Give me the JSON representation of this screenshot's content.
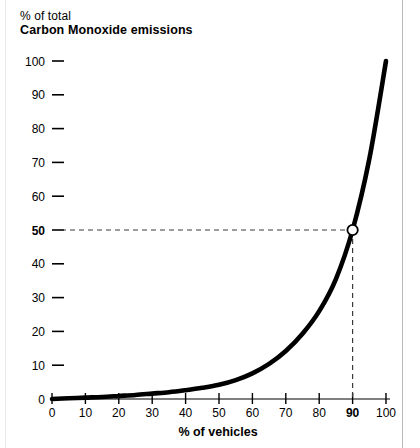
{
  "title": {
    "line1": "% of total",
    "line2": "Carbon Monoxide emissions"
  },
  "colors": {
    "background": "#ffffff",
    "curve": "#000000",
    "axis": "#000000",
    "tick": "#000000",
    "guide": "#555555",
    "marker_fill": "#ffffff",
    "marker_stroke": "#000000",
    "edge_rule": "#c9c9c9"
  },
  "chart_data": {
    "type": "line",
    "title": "% of total Carbon Monoxide emissions",
    "xlabel": "% of vehicles",
    "ylabel": "% of total Carbon Monoxide emissions",
    "xlim": [
      0,
      100
    ],
    "ylim": [
      0,
      100
    ],
    "grid": false,
    "legend": null,
    "xticks": [
      0,
      10,
      20,
      30,
      40,
      50,
      60,
      70,
      80,
      90,
      100
    ],
    "yticks": [
      0,
      10,
      20,
      30,
      40,
      50,
      60,
      70,
      80,
      90,
      100
    ],
    "xtick_labels": [
      "0",
      "10",
      "20",
      "30",
      "40",
      "50",
      "60",
      "70",
      "80",
      "90",
      "100"
    ],
    "ytick_labels": [
      "0",
      "10",
      "20",
      "30",
      "40",
      "50",
      "60",
      "70",
      "80",
      "90",
      "100"
    ],
    "emphasized_xtick": "90",
    "emphasized_ytick": "50",
    "series": [
      {
        "name": "Carbon Monoxide emissions curve",
        "x": [
          0,
          5,
          10,
          15,
          20,
          25,
          30,
          35,
          40,
          45,
          50,
          55,
          60,
          65,
          70,
          75,
          80,
          85,
          90,
          95,
          100
        ],
        "y": [
          0.0,
          0.2,
          0.4,
          0.6,
          0.9,
          1.2,
          1.6,
          2.0,
          2.6,
          3.3,
          4.2,
          5.6,
          7.6,
          10.4,
          14.2,
          19.3,
          26.0,
          35.5,
          50.0,
          71.0,
          100.0
        ]
      }
    ],
    "annotations": [
      {
        "name": "reference-point",
        "x": 90,
        "y": 50,
        "marker": "open-circle",
        "guides": [
          "horizontal-dashed-to-y-axis",
          "vertical-dashed-to-x-axis"
        ]
      }
    ]
  }
}
